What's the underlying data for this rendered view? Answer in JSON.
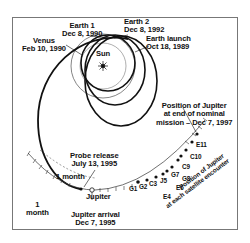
{
  "diagram": {
    "type": "trajectory",
    "colors": {
      "line": "#111111",
      "frame": "#777777",
      "background": "#ffffff",
      "thin_orbit": "#666666"
    },
    "center_body": {
      "label": "Sun",
      "icon": "sun-icon"
    },
    "labels": {
      "earth1": {
        "name": "Earth 1",
        "date": "Dec 8, 1990"
      },
      "earth2": {
        "name": "Earth 2",
        "date": "Dec 8, 1992"
      },
      "venus": {
        "name": "Venus",
        "date": "Feb 10, 1990"
      },
      "launch": {
        "name": "Earth launch",
        "date": "Oct 18, 1989"
      },
      "end_mission": {
        "line1": "Position of Jupiter",
        "line2": "at end of nominal",
        "line3": "mission – Dec 7, 1997"
      },
      "probe_release": {
        "line1": "Probe release",
        "line2": "July 13, 1995"
      },
      "one_month_a": "1 month",
      "one_month_b": {
        "line1": "1",
        "line2": "month"
      },
      "jupiter": "Jupiter",
      "jupiter_arrival": {
        "line1": "Jupiter arrival",
        "line2": "Dec 7, 1995"
      },
      "satellite_positions": {
        "line1": "Position of Jupiter",
        "line2": "at each satellite encounter"
      }
    },
    "encounters": [
      "G1",
      "G2",
      "C3",
      "E4",
      "J5",
      "E6",
      "G7",
      "G8",
      "C9",
      "C10",
      "E11"
    ]
  }
}
